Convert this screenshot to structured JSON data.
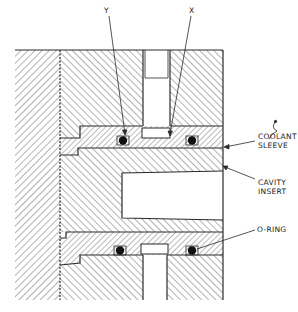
{
  "figure": {
    "type": "cross-section engineering drawing"
  },
  "labels": {
    "y": "Y",
    "x": "X",
    "coolant_sleeve_line1": "COOLANT",
    "coolant_sleeve_line2": "SLEEVE",
    "cavity_insert_line1": "CAVITY",
    "cavity_insert_line2": "INSERT",
    "o_ring": "O-RING"
  },
  "colors": {
    "ink": "#2a2a2a",
    "hatch": "#555555",
    "paper": "#ffffff",
    "seal": "#111111"
  }
}
